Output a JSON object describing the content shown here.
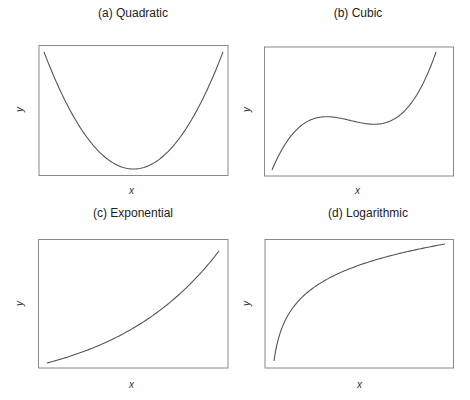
{
  "chart_data": [
    {
      "type": "line",
      "title": "(a) Quadratic",
      "xlabel": "x",
      "ylabel": "y",
      "grid": false,
      "ticks": false,
      "function": "quadratic",
      "x": [
        -1.0,
        -0.75,
        -0.5,
        -0.25,
        0.0,
        0.25,
        0.5,
        0.75,
        1.0
      ],
      "values": [
        1.0,
        0.5625,
        0.25,
        0.0625,
        0.0,
        0.0625,
        0.25,
        0.5625,
        1.0
      ]
    },
    {
      "type": "line",
      "title": "(b) Cubic",
      "xlabel": "x",
      "ylabel": "y",
      "grid": false,
      "ticks": false,
      "function": "cubic",
      "x": [
        0.0,
        0.1,
        0.2,
        0.3,
        0.4,
        0.5,
        0.6,
        0.7,
        0.8,
        0.9,
        1.0
      ],
      "values": [
        0.0,
        0.28,
        0.42,
        0.46,
        0.45,
        0.42,
        0.4,
        0.42,
        0.52,
        0.72,
        1.0
      ]
    },
    {
      "type": "line",
      "title": "(c) Exponential",
      "xlabel": "x",
      "ylabel": "y",
      "grid": false,
      "ticks": false,
      "function": "exponential",
      "x": [
        0.0,
        0.1,
        0.2,
        0.3,
        0.4,
        0.5,
        0.6,
        0.7,
        0.8,
        0.9,
        1.0
      ],
      "values": [
        0.0,
        0.04,
        0.09,
        0.14,
        0.2,
        0.27,
        0.36,
        0.47,
        0.6,
        0.78,
        1.0
      ]
    },
    {
      "type": "line",
      "title": "(d) Logarithmic",
      "xlabel": "x",
      "ylabel": "y",
      "grid": false,
      "ticks": false,
      "function": "logarithmic",
      "x": [
        0.0,
        0.1,
        0.2,
        0.3,
        0.4,
        0.5,
        0.6,
        0.7,
        0.8,
        0.9,
        1.0
      ],
      "values": [
        0.0,
        0.38,
        0.53,
        0.63,
        0.71,
        0.77,
        0.83,
        0.88,
        0.92,
        0.96,
        1.0
      ]
    }
  ],
  "panels": [
    {
      "title": "(a) Quadratic",
      "xlabel": "x",
      "ylabel": "y"
    },
    {
      "title": "(b) Cubic",
      "xlabel": "x",
      "ylabel": "y"
    },
    {
      "title": "(c) Exponential",
      "xlabel": "x",
      "ylabel": "y"
    },
    {
      "title": "(d) Logarithmic",
      "xlabel": "x",
      "ylabel": "y"
    }
  ],
  "style": {
    "line_color": "#555555",
    "frame_color": "#888888"
  }
}
